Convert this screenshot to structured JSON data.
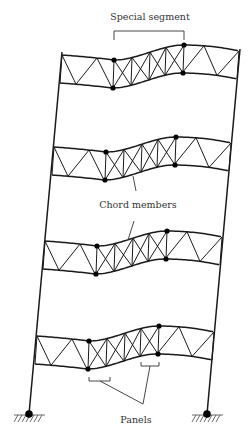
{
  "figure": {
    "labels": {
      "special_segment": "Special segment",
      "chord_members": "Chord members",
      "panels": "Panels"
    },
    "label_positions": {
      "special_segment": {
        "x": 150,
        "y": 20
      },
      "chord_members": {
        "x": 138,
        "y": 208
      },
      "panels": {
        "x": 136,
        "y": 423
      }
    },
    "colors": {
      "line": "#1a1a1a",
      "node": "#000000",
      "label": "#333333",
      "background": "#ffffff"
    },
    "columns": {
      "left": {
        "top": [
          62,
          52
        ],
        "bottom": [
          29,
          414
        ]
      },
      "right": {
        "top": [
          240,
          49
        ],
        "bottom": [
          207,
          414
        ]
      }
    },
    "supports": [
      {
        "name": "left-pin-support",
        "x": 29,
        "y": 414
      },
      {
        "name": "right-pin-support",
        "x": 207,
        "y": 414
      }
    ],
    "trusses": [
      {
        "name": "truss-level-4",
        "dx": 0,
        "dy": 0
      },
      {
        "name": "truss-level-3",
        "dx": -8,
        "dy": 92
      },
      {
        "name": "truss-level-2",
        "dx": -17,
        "dy": 186
      },
      {
        "name": "truss-level-1",
        "dx": -25,
        "dy": 281
      }
    ],
    "truss_template": {
      "left_x": 62,
      "right_x": 239,
      "depth": 28,
      "special_start_x": 114,
      "special_end_x": 184,
      "top_y_left": 55,
      "top_y_sl": 60,
      "top_y_sr": 45,
      "top_y_right": 51
    },
    "special_segment_bracket": {
      "x1": 114,
      "x2": 184,
      "y": 31,
      "tick": 9
    },
    "chord_leaders": [
      {
        "from": [
          136,
          191
        ],
        "to": [
          133,
          176
        ]
      },
      {
        "from": [
          134,
          221
        ],
        "to": [
          128,
          240
        ]
      }
    ],
    "panel_brackets": [
      {
        "x1": 89,
        "x2": 110,
        "y": 381
      },
      {
        "x1": 141,
        "x2": 159,
        "y": 366
      }
    ],
    "panel_leaders": [
      {
        "from": [
          100,
          381
        ],
        "to": [
          143,
          404
        ]
      },
      {
        "from": [
          150,
          366
        ],
        "to": [
          143,
          404
        ]
      }
    ]
  }
}
